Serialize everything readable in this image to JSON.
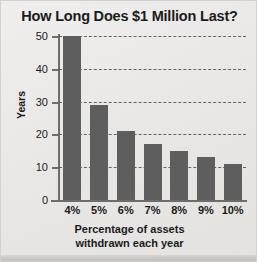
{
  "chart_data": {
    "type": "bar",
    "title": "How Long Does $1 Million Last?",
    "categories": [
      "4%",
      "5%",
      "6%",
      "7%",
      "8%",
      "9%",
      "10%"
    ],
    "values": [
      50,
      29,
      21,
      17,
      15,
      13,
      11
    ],
    "xlabel": "Percentage of assets withdrawn each year",
    "xlabel_line1": "Percentage of assets",
    "xlabel_line2": "withdrawn each year",
    "ylabel": "Years",
    "ylim": [
      0,
      50
    ],
    "yticks": [
      0,
      10,
      20,
      30,
      40,
      50
    ],
    "ytick_labels": [
      "0",
      "10",
      "20",
      "30",
      "40",
      "50"
    ],
    "grid": "horizontal-dashed",
    "legend": "none",
    "bar_color": "#5e5e5e",
    "axis_color": "#6d6d6d",
    "background_color": "#e9e8e6",
    "text_color": "#1b1b1b"
  }
}
